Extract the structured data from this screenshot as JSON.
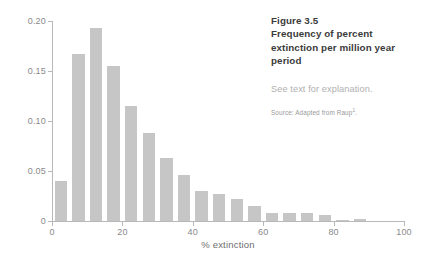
{
  "caption": {
    "figure_label": "Figure 3.5",
    "title_lines": [
      "Frequency of percent",
      "extinction per million year",
      "period"
    ],
    "note": "See text for explanation.",
    "source_prefix": "Source: Adapted from Raup",
    "source_superscript": "1",
    "source_suffix": "."
  },
  "colors": {
    "bar": "#c6c6c6",
    "axis": "#b8b8b8",
    "tick_label": "#8a8a8a",
    "axis_title": "#6e6e6e",
    "caption_title": "#3b3b3b",
    "caption_note": "#b0b0b0",
    "caption_source": "#9a9a9a",
    "background": "#ffffff"
  },
  "chart_data": {
    "type": "bar",
    "title": "Frequency of percent extinction per million year period",
    "xlabel": "% extinction",
    "ylabel": "Frequency",
    "xlim": [
      0,
      100
    ],
    "ylim": [
      0,
      0.2
    ],
    "grid": false,
    "legend": false,
    "bin_width": 5,
    "xticks": [
      0,
      20,
      40,
      60,
      80,
      100
    ],
    "xtick_labels": [
      "0",
      "20",
      "40",
      "60",
      "80",
      "100"
    ],
    "yticks": [
      0,
      0.05,
      0.1,
      0.15,
      0.2
    ],
    "ytick_labels": [
      "0",
      "0.05",
      "0.10",
      "0.15",
      "0.20"
    ],
    "bin_starts": [
      0,
      5,
      10,
      15,
      20,
      25,
      30,
      35,
      40,
      45,
      50,
      55,
      60,
      65,
      70,
      75,
      80,
      85,
      90,
      95
    ],
    "categories": [
      "0-5",
      "5-10",
      "10-15",
      "15-20",
      "20-25",
      "25-30",
      "30-35",
      "35-40",
      "40-45",
      "45-50",
      "50-55",
      "55-60",
      "60-65",
      "65-70",
      "70-75",
      "75-80",
      "80-85",
      "85-90",
      "90-95",
      "95-100"
    ],
    "values": [
      0.04,
      0.167,
      0.193,
      0.155,
      0.115,
      0.088,
      0.063,
      0.046,
      0.03,
      0.027,
      0.022,
      0.015,
      0.008,
      0.008,
      0.008,
      0.006,
      0.001,
      0.002,
      0.0,
      0.0
    ]
  }
}
